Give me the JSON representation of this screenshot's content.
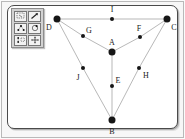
{
  "app": {
    "title": "Graph Canvas",
    "background_color": "#f7f7f7",
    "canvas_color": "#ffffff",
    "frame_color": "#4a4a4a"
  },
  "toolbar": {
    "name": "tool-palette",
    "background_color": "#d2d2d2",
    "buttons": [
      {
        "id": "select-region-tool",
        "icon": "lasso-select-icon",
        "tooltip": "Select region"
      },
      {
        "id": "zoom-tool",
        "icon": "zoom-arrow-icon",
        "tooltip": "Zoom"
      },
      {
        "id": "add-node-tool",
        "icon": "add-node-icon",
        "tooltip": "Add node"
      },
      {
        "id": "circle-layout-tool",
        "icon": "circle-layout-icon",
        "tooltip": "Circular layout"
      },
      {
        "id": "edit-node-tool",
        "icon": "edit-node-icon",
        "tooltip": "Edit node"
      },
      {
        "id": "move-tool",
        "icon": "move-arrows-icon",
        "tooltip": "Move"
      }
    ]
  },
  "graph": {
    "name": "vertex-graph",
    "edge_color": "#9a9a9a",
    "node_color": "#161616",
    "label_color": "#1a1a1a",
    "nodes": [
      {
        "id": "D",
        "label": "D",
        "x": 57,
        "y": 19,
        "size": "major",
        "label_x": 49,
        "label_y": 28
      },
      {
        "id": "I",
        "label": "I",
        "x": 112,
        "y": 19,
        "size": "minor",
        "label_x": 112,
        "label_y": 10
      },
      {
        "id": "C",
        "label": "C",
        "x": 167,
        "y": 19,
        "size": "major",
        "label_x": 174,
        "label_y": 28
      },
      {
        "id": "G",
        "label": "G",
        "x": 83,
        "y": 36,
        "size": "minor",
        "label_x": 89,
        "label_y": 31
      },
      {
        "id": "F",
        "label": "F",
        "x": 140,
        "y": 37,
        "size": "minor",
        "label_x": 139,
        "label_y": 29
      },
      {
        "id": "A",
        "label": "A",
        "x": 112,
        "y": 52,
        "size": "major",
        "label_x": 112,
        "label_y": 43
      },
      {
        "id": "J",
        "label": "J",
        "x": 83,
        "y": 68,
        "size": "minor",
        "label_x": 78,
        "label_y": 78
      },
      {
        "id": "H",
        "label": "H",
        "x": 139,
        "y": 68,
        "size": "minor",
        "label_x": 146,
        "label_y": 76
      },
      {
        "id": "E",
        "label": "E",
        "x": 112,
        "y": 86,
        "size": "minor",
        "label_x": 118,
        "label_y": 81
      },
      {
        "id": "B",
        "label": "B",
        "x": 112,
        "y": 120,
        "size": "major",
        "label_x": 112,
        "label_y": 132
      }
    ],
    "edges": [
      {
        "from": "D",
        "to": "I"
      },
      {
        "from": "I",
        "to": "C"
      },
      {
        "from": "D",
        "to": "G"
      },
      {
        "from": "G",
        "to": "A"
      },
      {
        "from": "A",
        "to": "F"
      },
      {
        "from": "F",
        "to": "C"
      },
      {
        "from": "D",
        "to": "J"
      },
      {
        "from": "J",
        "to": "B"
      },
      {
        "from": "A",
        "to": "E"
      },
      {
        "from": "E",
        "to": "B"
      },
      {
        "from": "B",
        "to": "H"
      },
      {
        "from": "H",
        "to": "C"
      }
    ]
  }
}
